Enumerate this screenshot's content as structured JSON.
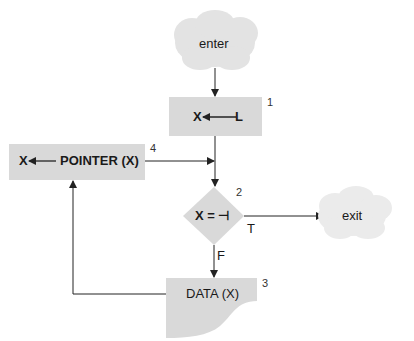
{
  "diagram": {
    "type": "flowchart",
    "colors": {
      "shape_fill": "#d9d9d9",
      "cloud_fill": "#e3e3e3",
      "line": "#222222"
    },
    "nodes": {
      "enter": {
        "label": "enter",
        "shape": "cloud"
      },
      "assign": {
        "label_left": "X",
        "label_right": "L",
        "number": "1",
        "shape": "process"
      },
      "decision": {
        "label": "X = ⊣",
        "number": "2",
        "shape": "decision"
      },
      "data": {
        "label": "DATA (X)",
        "number": "3",
        "shape": "document"
      },
      "pointer": {
        "label_left": "X",
        "label_right": "POINTER (X)",
        "number": "4",
        "shape": "process"
      },
      "exit": {
        "label": "exit",
        "shape": "cloud"
      }
    },
    "edges": {
      "true_label": "T",
      "false_label": "F"
    }
  }
}
